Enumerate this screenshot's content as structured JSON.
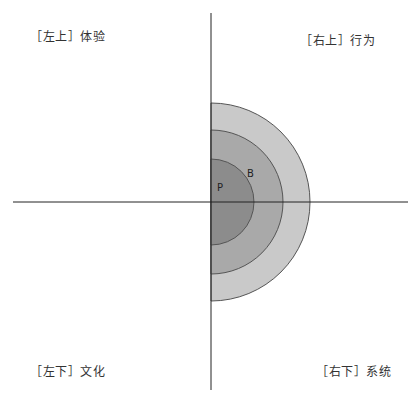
{
  "quadrants": {
    "top_left": {
      "label": "［左上］体验"
    },
    "top_right": {
      "label": "［右上］行为"
    },
    "bottom_left": {
      "label": "［左下］文化"
    },
    "bottom_right": {
      "label": "［右下］系统"
    }
  },
  "rings": [
    {
      "name": "outer",
      "radius": 99,
      "fill": "#c9c9c9",
      "label": ""
    },
    {
      "name": "middle",
      "radius": 72,
      "fill": "#a9a9a9",
      "label": "B"
    },
    {
      "name": "inner",
      "radius": 43,
      "fill": "#8c8c8c",
      "label": "P"
    }
  ],
  "colors": {
    "axis": "#222222",
    "ring_stroke": "#555555",
    "text": "#333333"
  }
}
